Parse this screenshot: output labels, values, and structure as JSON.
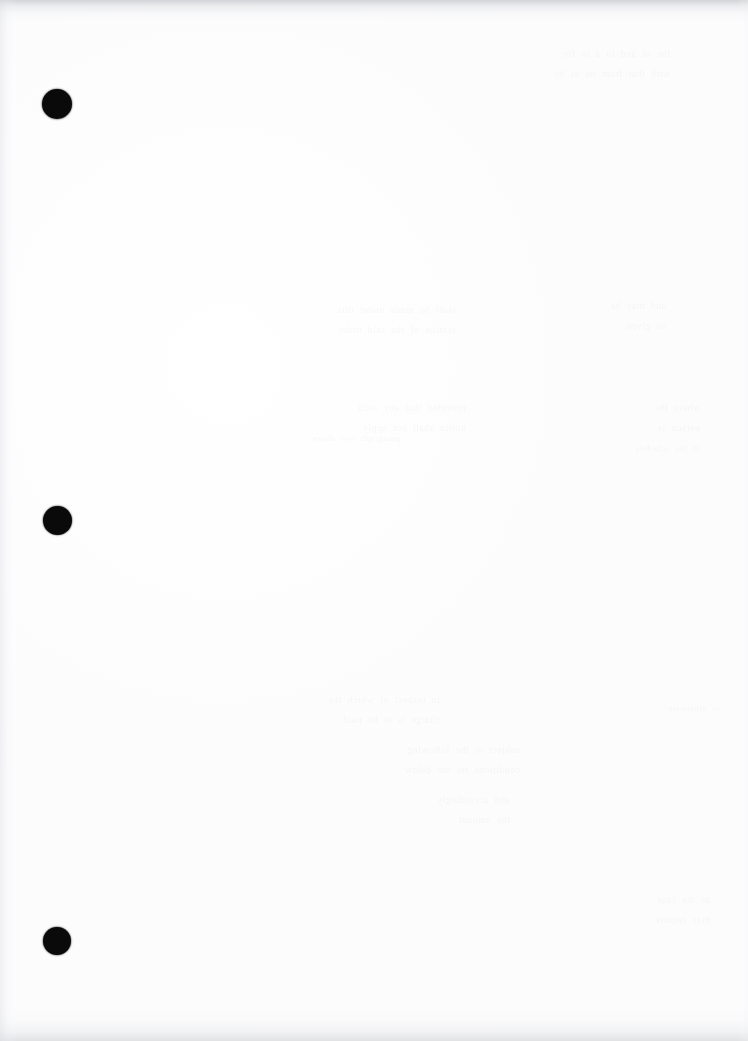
{
  "document": {
    "kind": "scanned-page",
    "page_background_color": "#fdfdfe",
    "width_px": 748,
    "height_px": 1041,
    "visible_text": "",
    "note": "Blank scanned sheet; no legible printed text."
  },
  "registration_marks": {
    "label": "binding-hole-mark",
    "color": "#0a0a0a",
    "count": 3,
    "items": [
      {
        "id": "mark-1",
        "cx": 57,
        "cy": 104,
        "d": 30
      },
      {
        "id": "mark-2",
        "cx": 57,
        "cy": 520,
        "d": 29
      },
      {
        "id": "mark-3",
        "cx": 57,
        "cy": 941,
        "d": 28
      }
    ]
  },
  "scan_artifacts": {
    "edges": {
      "top_shadow_color": "#b0b2b6",
      "bottom_shadow_color": "#bec0c4",
      "left_shadow_color": "#dee0e4",
      "right_shadow_color": "#f2f3f5"
    },
    "showthrough": [
      {
        "id": "ghost-a",
        "x": 420,
        "y": 44,
        "w": 250,
        "size": 10,
        "text": "the  of  and  in  a  to  for\nwith  that  from  on  as  by"
      },
      {
        "id": "ghost-b",
        "x": 226,
        "y": 300,
        "w": 230,
        "size": 10,
        "text": "shall  be  made  under  this\nsection  of  the  said  order"
      },
      {
        "id": "ghost-c",
        "x": 496,
        "y": 296,
        "w": 170,
        "size": 10,
        "text": "and  may  be\nso  given"
      },
      {
        "id": "ghost-d",
        "x": 206,
        "y": 398,
        "w": 260,
        "size": 10,
        "text": "provided  that  any  such\nnotice  shall  not  apply"
      },
      {
        "id": "ghost-e",
        "x": 520,
        "y": 398,
        "w": 180,
        "size": 10,
        "text": "where  the\nperson  is"
      },
      {
        "id": "ghost-f",
        "x": 200,
        "y": 690,
        "w": 240,
        "size": 10,
        "text": "in  respect  of  which  the\ncharge  is  to  be  paid"
      },
      {
        "id": "ghost-g",
        "x": 300,
        "y": 740,
        "w": 220,
        "size": 10,
        "text": "subject  to  the  following\nconditions  set  out  below"
      },
      {
        "id": "ghost-h",
        "x": 330,
        "y": 790,
        "w": 180,
        "size": 10,
        "text": "and  accordingly\nthe  amount"
      },
      {
        "id": "ghost-i",
        "x": 560,
        "y": 890,
        "w": 150,
        "size": 10,
        "text": "as  the  case\nmay  require"
      },
      {
        "id": "ghost-j",
        "x": 200,
        "y": 430,
        "w": 200,
        "size": 9,
        "text": "paragraph  two  above"
      },
      {
        "id": "ghost-k",
        "x": 520,
        "y": 440,
        "w": 180,
        "size": 9,
        "text": "in  the  schedule"
      },
      {
        "id": "ghost-l",
        "x": 600,
        "y": 700,
        "w": 120,
        "size": 9,
        "text": "or  otherwise"
      }
    ]
  }
}
